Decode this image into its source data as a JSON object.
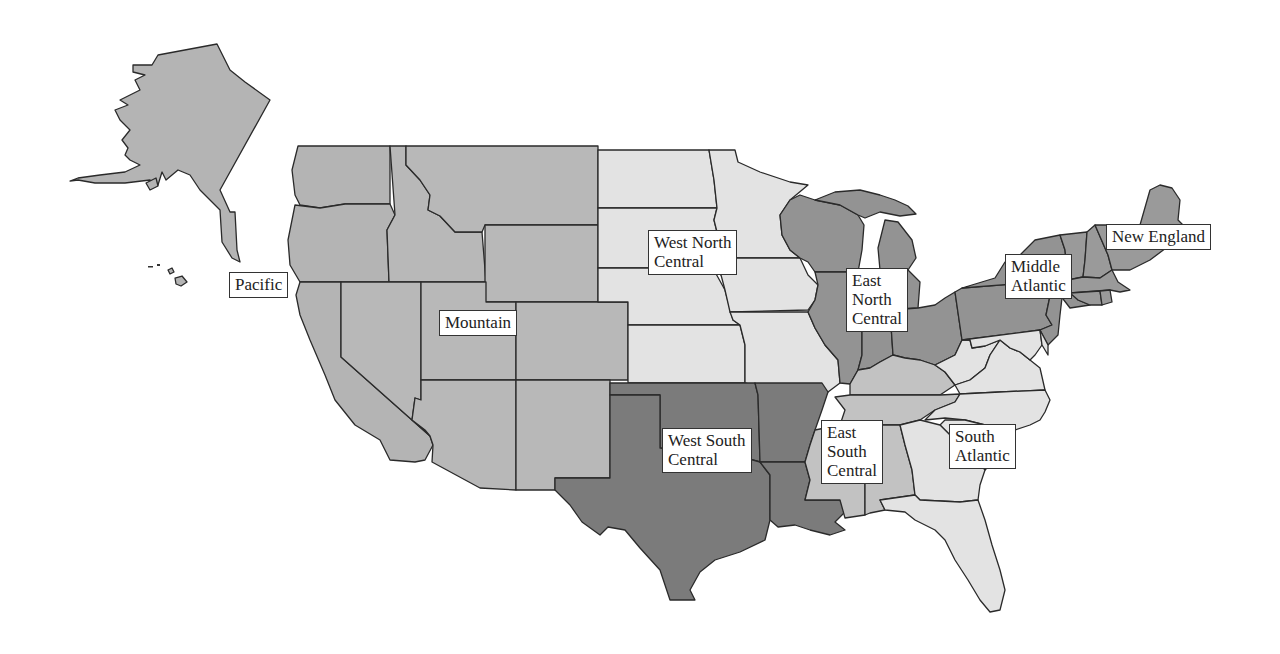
{
  "map": {
    "title": "U.S. Census Divisions",
    "colors": {
      "background": "#ffffff",
      "border": "#2a2a2a",
      "west_south_central": "#7b7b7b",
      "east_north_central": "#939393",
      "middle_atlantic": "#939393",
      "new_england": "#9a9a9a",
      "pacific": "#b4b4b4",
      "mountain": "#b8b8b8",
      "east_south_central": "#c2c2c2",
      "west_north_central": "#e3e3e3",
      "south_atlantic": "#e3e3e3"
    },
    "divisions": [
      {
        "id": "pacific",
        "label": "Pacific"
      },
      {
        "id": "mountain",
        "label": "Mountain"
      },
      {
        "id": "west_north_central",
        "label": "West North\nCentral"
      },
      {
        "id": "east_north_central",
        "label": "East\nNorth\nCentral"
      },
      {
        "id": "middle_atlantic",
        "label": "Middle\nAtlantic"
      },
      {
        "id": "new_england",
        "label": "New England"
      },
      {
        "id": "west_south_central",
        "label": "West South\nCentral"
      },
      {
        "id": "east_south_central",
        "label": "East\nSouth\nCentral"
      },
      {
        "id": "south_atlantic",
        "label": "South\nAtlantic"
      }
    ]
  }
}
